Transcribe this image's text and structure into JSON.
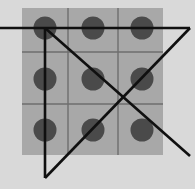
{
  "figure": {
    "canvas": {
      "width": 195,
      "height": 189
    },
    "colors": {
      "page_background": "#d9d9d9",
      "board_fill": "#a8a8a8",
      "grid_line": "#6e6e6e",
      "circle_fill": "#4a4a4a",
      "overlay_line": "#101010"
    },
    "board": {
      "x": 22,
      "y": 8,
      "width": 141,
      "height": 147,
      "rows": 3,
      "columns": 3,
      "grid_lines_vertical_x": [
        68,
        118
      ],
      "grid_lines_horizontal_y": [
        52,
        104
      ],
      "grid_line_width": 1.4
    },
    "circles": {
      "radius": 11.5,
      "count": 9,
      "items": [
        {
          "name": "circle-row1-col1",
          "cx": 45,
          "cy": 28
        },
        {
          "name": "circle-row1-col2",
          "cx": 93,
          "cy": 28
        },
        {
          "name": "circle-row1-col3",
          "cx": 142,
          "cy": 28
        },
        {
          "name": "circle-row2-col1",
          "cx": 45,
          "cy": 79
        },
        {
          "name": "circle-row2-col2",
          "cx": 93,
          "cy": 79
        },
        {
          "name": "circle-row2-col3",
          "cx": 142,
          "cy": 79
        },
        {
          "name": "circle-row3-col1",
          "cx": 45,
          "cy": 130
        },
        {
          "name": "circle-row3-col2",
          "cx": 93,
          "cy": 130
        },
        {
          "name": "circle-row3-col3",
          "cx": 142,
          "cy": 130
        }
      ]
    },
    "overlay_lines": {
      "stroke_width": 2.6,
      "items": [
        {
          "name": "overlay-line-horizontal",
          "x1": 0,
          "y1": 28,
          "x2": 190,
          "y2": 28
        },
        {
          "name": "overlay-line-vertical",
          "x1": 45,
          "y1": 28,
          "x2": 45,
          "y2": 178
        },
        {
          "name": "overlay-line-diagonal-descending",
          "x1": 45,
          "y1": 28,
          "x2": 190,
          "y2": 156
        },
        {
          "name": "overlay-line-diagonal-ascending",
          "x1": 45,
          "y1": 178,
          "x2": 190,
          "y2": 28
        }
      ]
    }
  },
  "chart_data": {
    "type": "scatter",
    "title": "",
    "xlabel": "",
    "ylabel": "",
    "xlim": [
      0,
      195
    ],
    "ylim": [
      0,
      189
    ],
    "grid": true,
    "legend": null,
    "categories": [
      "col1",
      "col2",
      "col3"
    ],
    "row_labels": [
      "row1",
      "row2",
      "row3"
    ],
    "points": [
      {
        "x": 45,
        "y": 28
      },
      {
        "x": 93,
        "y": 28
      },
      {
        "x": 142,
        "y": 28
      },
      {
        "x": 45,
        "y": 79
      },
      {
        "x": 93,
        "y": 79
      },
      {
        "x": 142,
        "y": 79
      },
      {
        "x": 45,
        "y": 130
      },
      {
        "x": 93,
        "y": 130
      },
      {
        "x": 142,
        "y": 130
      }
    ],
    "annotations": [
      {
        "label": "horizontal line through top row",
        "from": [
          0,
          28
        ],
        "to": [
          190,
          28
        ]
      },
      {
        "label": "vertical line through left column",
        "from": [
          45,
          28
        ],
        "to": [
          45,
          178
        ]
      },
      {
        "label": "descending diagonal",
        "from": [
          45,
          28
        ],
        "to": [
          190,
          156
        ]
      },
      {
        "label": "ascending diagonal",
        "from": [
          45,
          178
        ],
        "to": [
          190,
          28
        ]
      }
    ]
  }
}
